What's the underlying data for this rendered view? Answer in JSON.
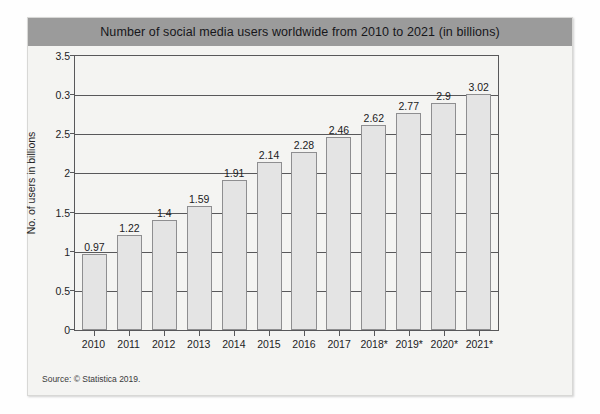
{
  "figure": {
    "title": "Number of social media users worldwide from 2010 to 2021  (in billions)",
    "source_note": "Source: © Statistica 2019.",
    "colors": {
      "title_band": "#9b9b9b",
      "panel_background": "#f4f4f2",
      "bar_fill": "#e4e4e4",
      "bar_stroke": "#8e8e90",
      "axis": "#58585a",
      "text": "#1d1d1f"
    }
  },
  "chart_data": {
    "type": "bar",
    "title": "Number of social media users worldwide from 2010 to 2021  (in billions)",
    "xlabel": "",
    "ylabel": "No. of users in billions",
    "categories": [
      "2010",
      "2011",
      "2012",
      "2013",
      "2014",
      "2015",
      "2016",
      "2017",
      "2018*",
      "2019*",
      "2020*",
      "2021*"
    ],
    "values": [
      0.97,
      1.22,
      1.4,
      1.59,
      1.91,
      2.14,
      2.28,
      2.46,
      2.62,
      2.77,
      2.9,
      3.02
    ],
    "value_labels": [
      "0.97",
      "1.22",
      "1.4",
      "1.59",
      "1.91",
      "2.14",
      "2.28",
      "2.46",
      "2.62",
      "2.77",
      "2.9",
      "3.02"
    ],
    "ylim": [
      0,
      3.5
    ],
    "ytick_values": [
      0,
      0.5,
      1,
      1.5,
      2,
      2.5,
      3,
      3.5
    ],
    "ytick_labels": [
      "0",
      "0.5",
      "1",
      "1.5",
      "2",
      "2.5",
      "0.3",
      "3.5"
    ],
    "grid": true,
    "grid_axis": "y",
    "legend": "none",
    "annotations": [
      "* denotes projected / forecast values"
    ]
  }
}
